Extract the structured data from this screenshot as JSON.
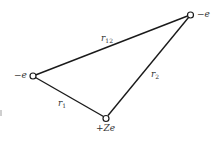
{
  "diagram": {
    "title": "",
    "nodes": [
      {
        "id": "electron-1",
        "label": "−e",
        "x": 33,
        "y": 76
      },
      {
        "id": "electron-2",
        "label": "−e",
        "x": 190,
        "y": 15
      },
      {
        "id": "nucleus",
        "label": "+Ze",
        "x": 106,
        "y": 118
      }
    ],
    "edges": [
      {
        "from": "electron-1",
        "to": "electron-2",
        "label_base": "r",
        "label_sub": "12"
      },
      {
        "from": "electron-2",
        "to": "nucleus",
        "label_base": "r",
        "label_sub": "2"
      },
      {
        "from": "electron-1",
        "to": "nucleus",
        "label_base": "r",
        "label_sub": "1"
      }
    ],
    "colors": {
      "line": "#1a1a1a",
      "text": "#333333",
      "background": "#ffffff"
    }
  }
}
